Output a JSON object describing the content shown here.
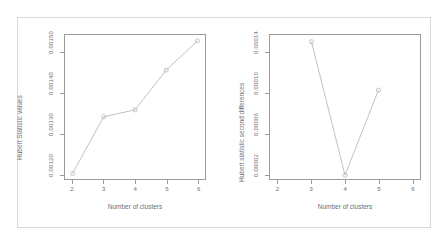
{
  "figure": {
    "background": "#ffffff",
    "outer_border_color": "#d8d8d8",
    "axis_color": "#9a9a9a",
    "text_color": "#6e6e6e",
    "line_color": "#b9b9b9",
    "point_color": "#bdbdbd"
  },
  "chart_data": [
    {
      "type": "line",
      "panel": "left",
      "title": "",
      "xlabel": "Number of clusters",
      "ylabel": "Hubert Statistic values",
      "x": [
        2,
        3,
        4,
        5,
        6
      ],
      "values": [
        0.0012,
        0.00134,
        0.001357,
        0.001455,
        0.001527
      ],
      "xticks": [
        "2",
        "3",
        "4",
        "5",
        "6"
      ],
      "yticks": [
        "0.00120",
        "0.00130",
        "0.00140",
        "0.00150"
      ],
      "ytick_values": [
        0.0012,
        0.0013,
        0.0014,
        0.0015
      ],
      "xlim": [
        1.76,
        6.24
      ],
      "ylim": [
        0.0011865,
        0.0015415
      ],
      "grid": false,
      "legend": "none",
      "markers": "open-circle"
    },
    {
      "type": "line",
      "panel": "right",
      "title": "",
      "xlabel": "Number of clusters",
      "ylabel": "Hubert statistic second differences",
      "x": [
        3,
        4,
        5
      ],
      "values": [
        0.000133,
        1.85e-05,
        9.15e-05
      ],
      "xticks": [
        "2",
        "3",
        "4",
        "5",
        "6"
      ],
      "xtick_values": [
        2,
        3,
        4,
        5,
        6
      ],
      "yticks": [
        "0.00002",
        "0.00006",
        "0.00010",
        "0.00014"
      ],
      "ytick_values": [
        2e-05,
        6e-05,
        0.0001,
        0.00014
      ],
      "xlim": [
        1.76,
        6.24
      ],
      "ylim": [
        1.52e-05,
        0.0001388
      ],
      "grid": false,
      "legend": "none",
      "markers": "open-circle"
    }
  ]
}
